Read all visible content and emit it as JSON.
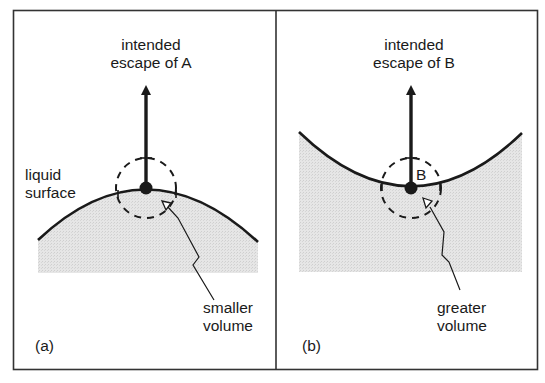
{
  "figure": {
    "colors": {
      "ink": "#1a1a1a",
      "frame": "#333333",
      "liquid_fill": "#e4e4e4",
      "background": "#ffffff"
    },
    "panel_a": {
      "tag": "(a)",
      "title_line1": "intended",
      "title_line2": "escape of A",
      "surface_label_line1": "liquid",
      "surface_label_line2": "surface",
      "volume_label_line1": "smaller",
      "volume_label_line2": "volume",
      "surface_shape": "convex",
      "molecule": "A"
    },
    "panel_b": {
      "tag": "(b)",
      "title_line1": "intended",
      "title_line2": "escape of B",
      "molecule_label": "B",
      "volume_label_line1": "greater",
      "volume_label_line2": "volume",
      "surface_shape": "concave",
      "molecule": "B"
    }
  }
}
